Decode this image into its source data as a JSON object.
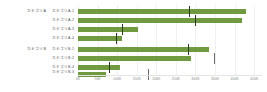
{
  "chart_data": {
    "type": "bar",
    "title": "",
    "subtitle": "",
    "xlabel": "",
    "ylabel": "",
    "orientation": "horizontal",
    "grid": true,
    "legend": "none",
    "xlim": [
      0,
      470000
    ],
    "xticks": [
      0,
      50000,
      100000,
      150000,
      200000,
      250000,
      300000,
      350000,
      400000,
      450000
    ],
    "xticklabels": [
      "0K",
      "50K",
      "100K",
      "150K",
      "200K",
      "250K",
      "300K",
      "350K",
      "400K",
      "450K"
    ],
    "groups": [
      {
        "label": "カテゴリA",
        "rows": [
          {
            "label": "カテゴリA-1",
            "value": 428000,
            "target": 284000
          },
          {
            "label": "カテゴリA-2",
            "value": 420000,
            "target": 300000
          },
          {
            "label": "カテゴリA-3",
            "value": 152000,
            "target": 112000
          },
          {
            "label": "カテゴリA-4",
            "value": 112000,
            "target": 98000
          }
        ]
      },
      {
        "label": "カテゴリB",
        "rows": [
          {
            "label": "カテゴリB-1",
            "value": 335000,
            "target": 282000
          },
          {
            "label": "カテゴリB-2",
            "value": 288000,
            "target": 348000
          },
          {
            "label": "カテゴリB-4",
            "value": 108000,
            "target": 80000
          },
          {
            "label": "カテゴリB-3",
            "value": 72000,
            "target": 180000
          }
        ]
      }
    ],
    "colors": {
      "bar": "#6f9a3f",
      "marker": "#2e3a22",
      "marker_dim": "#6b6b6b",
      "grid": "#f0f0f0",
      "axis_text": "#8a8a8a",
      "label_text": "#555555",
      "background": "#ffffff"
    }
  }
}
